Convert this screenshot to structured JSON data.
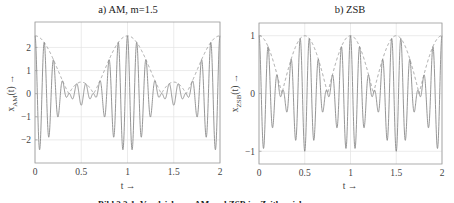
{
  "figure": {
    "caption": "Bild 2.2-1: Vergleich von AM und ZSB im Zeitbereich"
  },
  "chart_data": [
    {
      "type": "line",
      "title": "a)  AM,  m=1.5",
      "xlabel": "t →",
      "ylabel": "x_AM(t) →",
      "ylabel_main": "x",
      "ylabel_sub": "AM",
      "ylabel_tail": "(t) →",
      "xlim": [
        0,
        2
      ],
      "ylim": [
        -3,
        3.1
      ],
      "xticks": [
        0,
        0.5,
        1,
        1.5,
        2
      ],
      "xtick_labels": [
        "0",
        "0.5",
        "1",
        "1.5",
        "2"
      ],
      "yticks": [
        -2,
        -1,
        0,
        1,
        2
      ],
      "ytick_labels": [
        "−2",
        "−1",
        "0",
        "1",
        "2"
      ],
      "grid": true,
      "series": [
        {
          "name": "signal",
          "formula": "(1 + m*cos(2*pi*fm*t)) * cos(2*pi*fc*t)",
          "m": 1.5,
          "fm": 1,
          "fc": 10,
          "style": "solid",
          "color": "#8a8a8a"
        },
        {
          "name": "envelope",
          "formula": "|1 + m*cos(2*pi*fm*t)|",
          "m": 1.5,
          "fm": 1,
          "style": "dashed",
          "color": "#9a9a9a"
        }
      ],
      "key_points": {
        "envelope_max": 2.5,
        "envelope_max_at_t": [
          0,
          1,
          2
        ],
        "envelope_min": 0.5,
        "envelope_min_at_t": [
          0.5,
          1.5
        ],
        "signal_min_approx": -2.45
      }
    },
    {
      "type": "line",
      "title": "b)   ZSB",
      "xlabel": "t →",
      "ylabel": "x_ZSB(t) →",
      "ylabel_main": "x",
      "ylabel_sub": "ZSB",
      "ylabel_tail": "(t) →",
      "xlim": [
        0,
        2
      ],
      "ylim": [
        -1.22,
        1.22
      ],
      "xticks": [
        0,
        0.5,
        1,
        1.5,
        2
      ],
      "xtick_labels": [
        "0",
        "0.5",
        "1",
        "1.5",
        "2"
      ],
      "yticks": [
        -1,
        0,
        1
      ],
      "ytick_labels": [
        "−1",
        "0",
        "1"
      ],
      "grid": true,
      "series": [
        {
          "name": "signal",
          "formula": "cos(2*pi*fm*t) * cos(2*pi*fc*t)",
          "fm": 1,
          "fc": 10,
          "style": "solid",
          "color": "#8a8a8a"
        },
        {
          "name": "envelope",
          "formula": "|cos(2*pi*fm*t)|",
          "fm": 1,
          "style": "dashed",
          "color": "#9a9a9a"
        }
      ],
      "key_points": {
        "envelope_max": 1,
        "envelope_max_at_t": [
          0,
          0.5,
          1,
          1.5,
          2
        ],
        "envelope_zero_at_t": [
          0.25,
          0.75,
          1.25,
          1.75
        ],
        "signal_min_approx": -1
      }
    }
  ],
  "colors": {
    "frame": "#9a9a9a",
    "grid": "#e2e2e2",
    "signal": "#8a8a8a",
    "envelope": "#9a9a9a"
  }
}
